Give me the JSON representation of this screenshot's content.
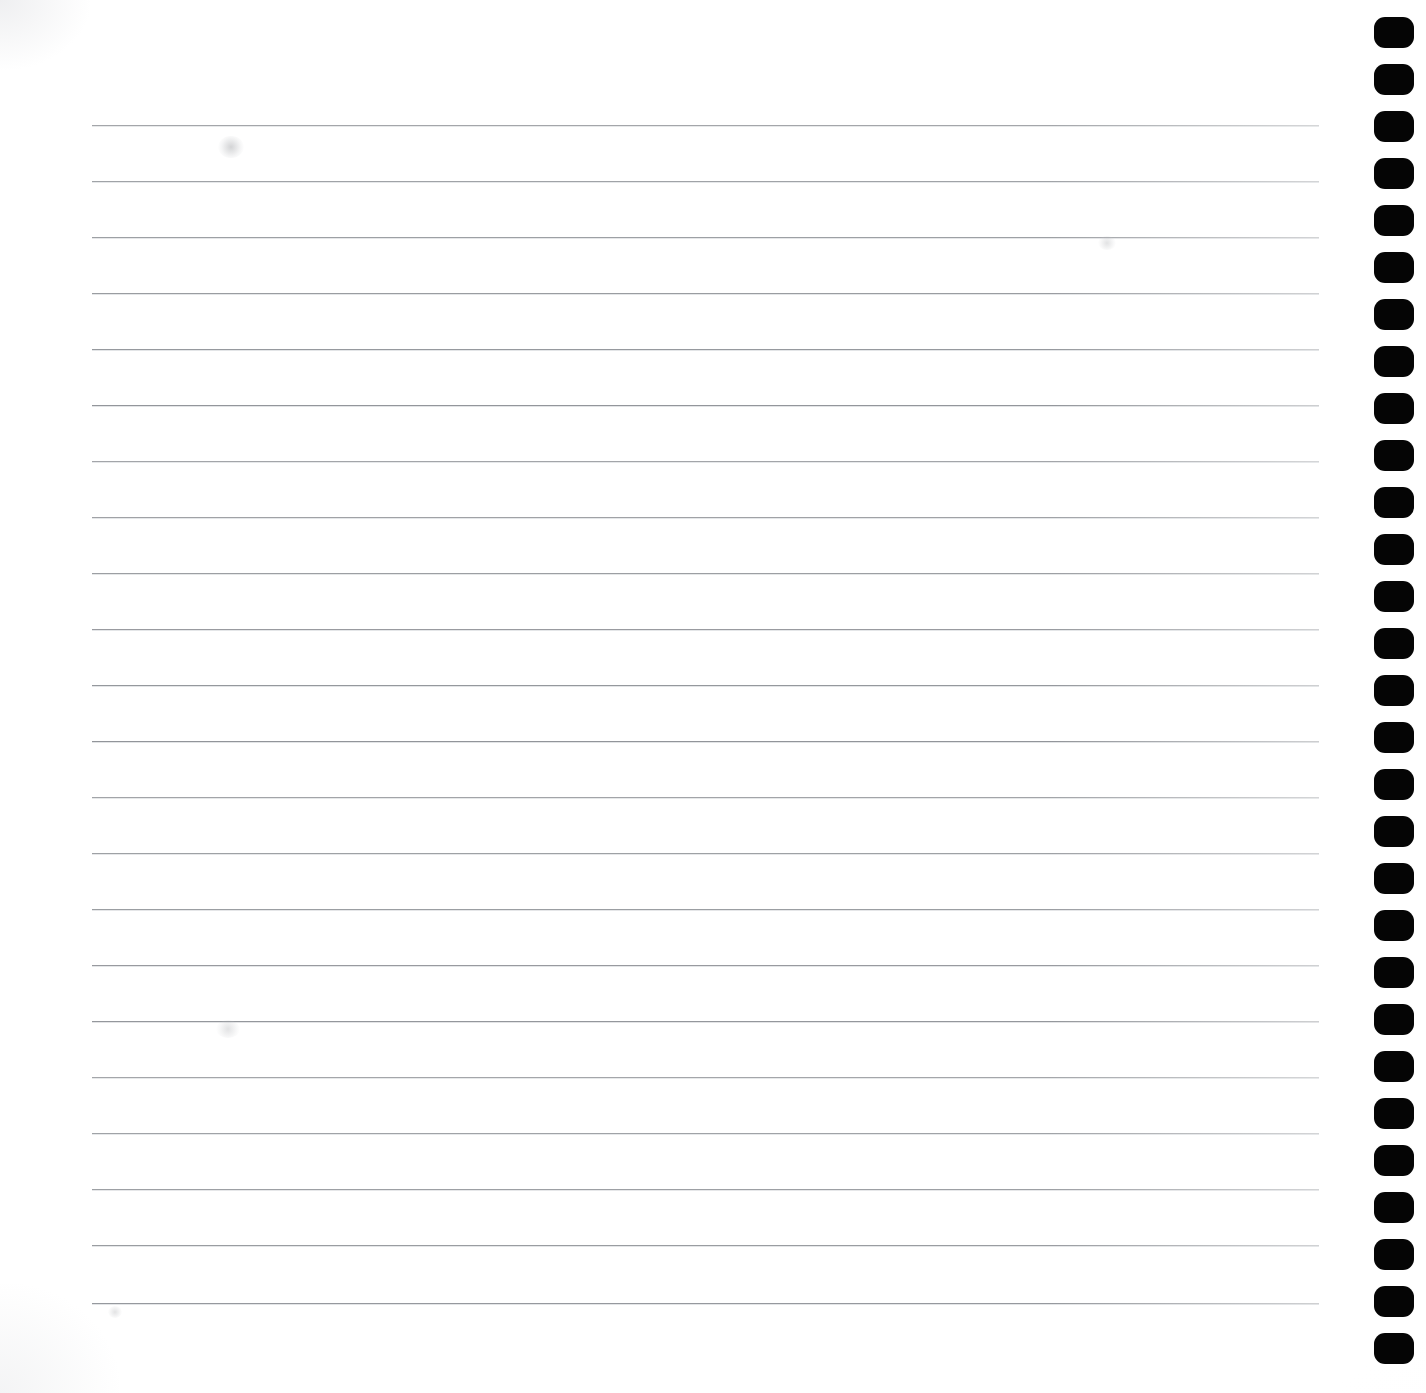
{
  "document": {
    "kind": "scanned-ruled-notebook-page",
    "title": "Blank lined notebook page",
    "page_width": 1426,
    "page_height": 1393,
    "background_color": "#ffffff",
    "content_text": "",
    "has_handwriting": false,
    "has_printed_text": false
  },
  "ruled_lines": {
    "count": 22,
    "color": "#8e9196",
    "thickness_px": 1,
    "left_x": 92,
    "right_x": 1319,
    "first_line_y": 125,
    "spacing_px": 56,
    "y_positions": [
      125,
      181,
      237,
      293,
      349,
      405,
      461,
      517,
      573,
      629,
      685,
      741,
      797,
      853,
      909,
      965,
      1021,
      1077,
      1133,
      1189,
      1245,
      1303
    ]
  },
  "binding_holes": {
    "count": 29,
    "color": "#050505",
    "shape": "rounded-rectangle",
    "left_x": 1374,
    "width_px": 40,
    "height_px": 31,
    "corner_radius_px": 11,
    "first_hole_y": 17,
    "spacing_px": 47,
    "y_positions": [
      17,
      64,
      111,
      158,
      205,
      252,
      299,
      346,
      393,
      440,
      487,
      534,
      581,
      628,
      675,
      722,
      769,
      816,
      863,
      910,
      957,
      1004,
      1051,
      1098,
      1145,
      1192,
      1239,
      1286,
      1333
    ]
  },
  "smudges": [
    {
      "name": "smudge-upper-left",
      "x": 218,
      "y": 136,
      "w": 26,
      "h": 22,
      "variant": "a"
    },
    {
      "name": "smudge-mid-left",
      "x": 216,
      "y": 1020,
      "w": 24,
      "h": 18,
      "variant": "b"
    },
    {
      "name": "smudge-upper-right",
      "x": 1098,
      "y": 236,
      "w": 18,
      "h": 14,
      "variant": "b"
    },
    {
      "name": "smudge-lower-left",
      "x": 108,
      "y": 1306,
      "w": 14,
      "h": 12,
      "variant": "b"
    }
  ],
  "margins": {
    "left_margin_px": 92,
    "right_content_edge_px": 1319,
    "top_margin_px": 125,
    "bottom_margin_px": 90,
    "hole_strip_start_px": 1360
  }
}
